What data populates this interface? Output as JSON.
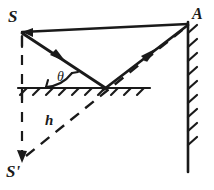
{
  "figure": {
    "type": "optics-ray-diagram",
    "width": 214,
    "height": 190,
    "background_color": "#ffffff",
    "ink_color": "#1a1a1a"
  },
  "labels": {
    "source": "S",
    "image_source": "S'",
    "wall_point": "A",
    "height": "h",
    "angle": "θ"
  },
  "points": {
    "S": {
      "x": 22,
      "y": 32,
      "label": "S",
      "role": "light-source"
    },
    "A": {
      "x": 188,
      "y": 22,
      "label": "A",
      "role": "wall-target-point"
    },
    "S_prime": {
      "x": 22,
      "y": 160,
      "label": "S'",
      "role": "virtual-image-of-source"
    },
    "reflection_point": {
      "x": 105,
      "y": 88,
      "label": "",
      "role": "mirror-reflection-point"
    }
  },
  "lines": {
    "top_horizontal": {
      "name": "direct-path-S-to-A",
      "style": "solid",
      "from": "S",
      "to": "A",
      "arrow": "none"
    },
    "incident_ray": {
      "name": "incident-ray-S-to-mirror",
      "style": "solid",
      "from": "S",
      "to": "reflection_point",
      "arrow": "mid-forward"
    },
    "reflected_ray": {
      "name": "reflected-ray-mirror-to-A",
      "style": "solid",
      "from": "reflection_point",
      "to": "A",
      "arrow": "mid-forward"
    },
    "image_ray": {
      "name": "virtual-ray-Sprime-to-A",
      "style": "dashed",
      "from": "S_prime",
      "to": "A",
      "arrow": "none",
      "label": "h"
    },
    "vertical_drop": {
      "name": "vertical-drop-S-to-Sprime",
      "style": "dashed",
      "from": "S",
      "to": "S_prime",
      "arrow": "end-down"
    }
  },
  "surfaces": {
    "mirror": {
      "name": "horizontal-mirror-surface",
      "orientation": "horizontal",
      "y": 88,
      "x_start": 18,
      "x_end": 150,
      "hatching": "below-right-slanted"
    },
    "wall": {
      "name": "vertical-wall-surface",
      "orientation": "vertical",
      "x": 188,
      "y_start": 22,
      "y_end": 172,
      "hatching": "right-up-slanted"
    }
  },
  "angle_marker": {
    "name": "angle-of-incidence",
    "symbol": "θ",
    "vertex": "reflection_point",
    "between": [
      "mirror-surface",
      "incident-ray"
    ],
    "label_x": 62,
    "label_y": 79
  }
}
